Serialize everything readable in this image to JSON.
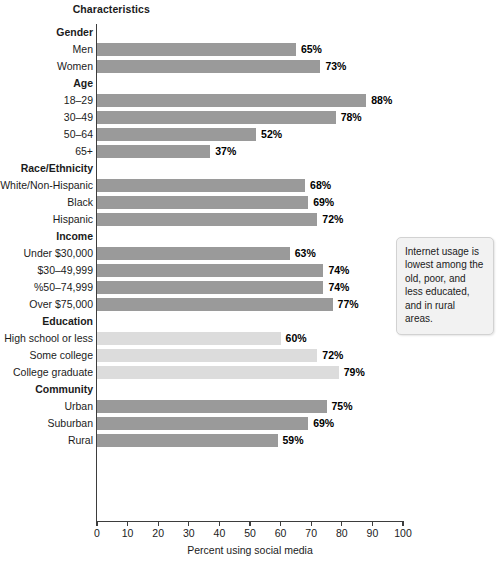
{
  "chart_data": {
    "type": "bar",
    "orientation": "horizontal",
    "title": "Characteristics",
    "xlabel": "Percent using social media",
    "ylabel": "",
    "xlim": [
      0,
      100
    ],
    "xticks": [
      0,
      10,
      20,
      30,
      40,
      50,
      60,
      70,
      80,
      90,
      100
    ],
    "grid": false,
    "legend": false,
    "value_suffix": "%",
    "colors": {
      "bar_default": "#9a9a9a",
      "bar_light": "#dcdcdc",
      "axis": "#3d3d3d",
      "text": "#1b1b1b",
      "callout_bg": "#f2f2f2",
      "callout_border": "#d2d2d2"
    },
    "groups": [
      {
        "name": "Gender",
        "shade": "default",
        "items": [
          {
            "label": "Men",
            "value": 65,
            "value_label": "65%"
          },
          {
            "label": "Women",
            "value": 73,
            "value_label": "73%"
          }
        ]
      },
      {
        "name": "Age",
        "shade": "default",
        "items": [
          {
            "label": "18–29",
            "value": 88,
            "value_label": "88%"
          },
          {
            "label": "30–49",
            "value": 78,
            "value_label": "78%"
          },
          {
            "label": "50–64",
            "value": 52,
            "value_label": "52%"
          },
          {
            "label": "65+",
            "value": 37,
            "value_label": "37%"
          }
        ]
      },
      {
        "name": "Race/Ethnicity",
        "shade": "default",
        "items": [
          {
            "label": "White/Non-Hispanic",
            "value": 68,
            "value_label": "68%"
          },
          {
            "label": "Black",
            "value": 69,
            "value_label": "69%"
          },
          {
            "label": "Hispanic",
            "value": 72,
            "value_label": "72%"
          }
        ]
      },
      {
        "name": "Income",
        "shade": "default",
        "items": [
          {
            "label": "Under $30,000",
            "value": 63,
            "value_label": "63%"
          },
          {
            "label": "$30–49,999",
            "value": 74,
            "value_label": "74%"
          },
          {
            "label": "%50–74,999",
            "value": 74,
            "value_label": "74%"
          },
          {
            "label": "Over $75,000",
            "value": 77,
            "value_label": "77%"
          }
        ]
      },
      {
        "name": "Education",
        "shade": "light",
        "items": [
          {
            "label": "High school or less",
            "value": 60,
            "value_label": "60%"
          },
          {
            "label": "Some college",
            "value": 72,
            "value_label": "72%"
          },
          {
            "label": "College graduate",
            "value": 79,
            "value_label": "79%"
          }
        ]
      },
      {
        "name": "Community",
        "shade": "default",
        "items": [
          {
            "label": "Urban",
            "value": 75,
            "value_label": "75%"
          },
          {
            "label": "Suburban",
            "value": 69,
            "value_label": "69%"
          },
          {
            "label": "Rural",
            "value": 59,
            "value_label": "59%"
          }
        ]
      }
    ],
    "annotations": [
      {
        "text": "Internet usage is lowest among the old, poor, and less educated, and in rural areas."
      }
    ]
  }
}
